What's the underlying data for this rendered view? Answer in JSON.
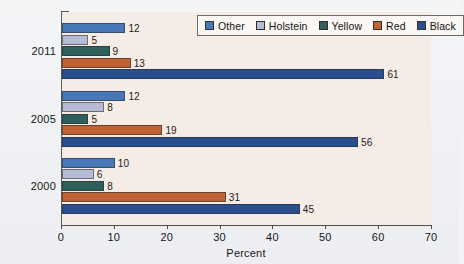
{
  "chart_data": {
    "type": "bar",
    "orientation": "horizontal",
    "title": "",
    "subtitle": "",
    "xlabel": "Percent",
    "ylabel": "",
    "xlim": [
      0,
      70
    ],
    "xticks": [
      0,
      10,
      20,
      30,
      40,
      50,
      60,
      70
    ],
    "xtick_labels": [
      "0",
      "10",
      "20",
      "30",
      "40",
      "50",
      "60",
      "70"
    ],
    "categories": [
      "2011",
      "2005",
      "2000"
    ],
    "grid": false,
    "legend_position": "top-right",
    "series": [
      {
        "name": "Other",
        "color": "#4878b8",
        "values": [
          12,
          12,
          10
        ]
      },
      {
        "name": "Holstein",
        "color": "#b6bcd6",
        "values": [
          5,
          8,
          6
        ]
      },
      {
        "name": "Yellow",
        "color": "#2e5f5c",
        "values": [
          9,
          5,
          8
        ]
      },
      {
        "name": "Red",
        "color": "#c06233",
        "values": [
          13,
          19,
          31
        ]
      },
      {
        "name": "Black",
        "color": "#2a4f8f",
        "values": [
          61,
          56,
          45
        ]
      }
    ]
  },
  "axes": {
    "x_title": "Percent",
    "tick_0": "0",
    "tick_1": "10",
    "tick_2": "20",
    "tick_3": "30",
    "tick_4": "40",
    "tick_5": "50",
    "tick_6": "60",
    "tick_7": "70",
    "cat_0": "2011",
    "cat_1": "2005",
    "cat_2": "2000"
  },
  "legend": {
    "items": [
      {
        "label": "Other"
      },
      {
        "label": "Holstein"
      },
      {
        "label": "Yellow"
      },
      {
        "label": "Red"
      },
      {
        "label": "Black"
      }
    ]
  },
  "colors": {
    "other": "#4878b8",
    "holstein": "#b6bcd6",
    "yellow": "#2e5f5c",
    "red": "#c06233",
    "black": "#2a4f8f",
    "plot_background": "#f5ece6",
    "page_background": "#f2f3f5",
    "axis": "#4d4d4d"
  }
}
